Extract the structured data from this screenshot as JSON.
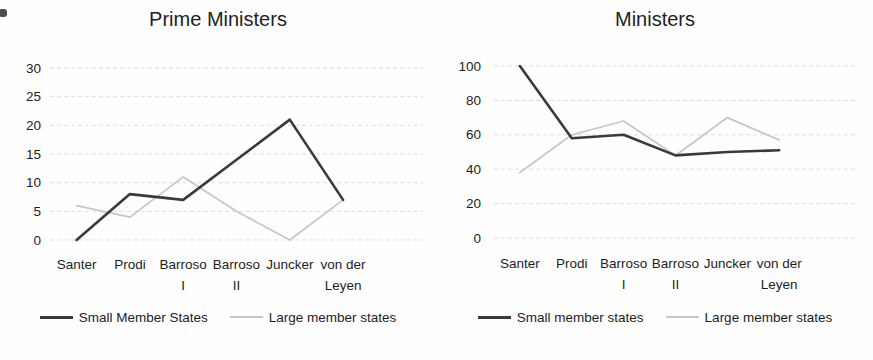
{
  "page": {
    "background": "#fefefe",
    "text_color": "#1d1d1d",
    "gridline_color": "#d9d9d9"
  },
  "chart_data": [
    {
      "type": "line",
      "title": "Prime Ministers",
      "xlabel": "",
      "ylabel": "",
      "categories": [
        "Santer",
        "Prodi",
        "Barroso I",
        "Barroso II",
        "Juncker",
        "von der Leyen"
      ],
      "category_lines": [
        [
          "Santer"
        ],
        [
          "Prodi"
        ],
        [
          "Barroso",
          "I"
        ],
        [
          "Barroso",
          "II"
        ],
        [
          "Juncker"
        ],
        [
          "von der",
          "Leyen"
        ]
      ],
      "ylim": [
        0,
        30
      ],
      "yticks": [
        0,
        5,
        10,
        15,
        20,
        25,
        30
      ],
      "grid": true,
      "legend_position": "bottom",
      "x_slots": 7,
      "series": [
        {
          "name": "Small Member States",
          "color": "#3a3a3a",
          "stroke_width": 2.6,
          "values": [
            0,
            8,
            7,
            14,
            21,
            7
          ]
        },
        {
          "name": "Large member states",
          "color": "#c7c7c7",
          "stroke_width": 1.8,
          "values": [
            6,
            4,
            11,
            5,
            0,
            7
          ]
        }
      ]
    },
    {
      "type": "line",
      "title": "Ministers",
      "xlabel": "",
      "ylabel": "",
      "categories": [
        "Santer",
        "Prodi",
        "Barroso I",
        "Barroso II",
        "Juncker",
        "von der Leyen"
      ],
      "category_lines": [
        [
          "Santer"
        ],
        [
          "Prodi"
        ],
        [
          "Barroso",
          "I"
        ],
        [
          "Barroso",
          "II"
        ],
        [
          "Juncker"
        ],
        [
          "von der",
          "Leyen"
        ]
      ],
      "ylim": [
        0,
        100
      ],
      "yticks": [
        0,
        20,
        40,
        60,
        80,
        100
      ],
      "grid": true,
      "legend_position": "bottom",
      "x_slots": 7,
      "series": [
        {
          "name": "Small member states",
          "color": "#3a3a3a",
          "stroke_width": 2.6,
          "values": [
            100,
            58,
            60,
            48,
            50,
            51
          ]
        },
        {
          "name": "Large member states",
          "color": "#c7c7c7",
          "stroke_width": 1.8,
          "values": [
            38,
            60,
            68,
            48,
            70,
            57
          ]
        }
      ]
    }
  ]
}
